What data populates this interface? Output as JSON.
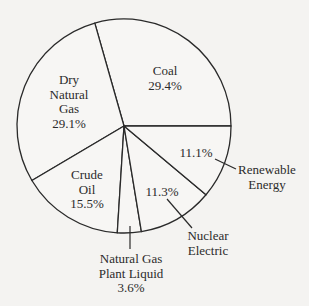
{
  "chart_data": {
    "type": "pie",
    "title": "",
    "start_angle_deg": 0,
    "direction": "counterclockwise",
    "grid": false,
    "legend": "none (direct labels)",
    "slices": [
      {
        "name": "Coal",
        "value": 29.4,
        "label_lines": [
          "Coal",
          "29.4%"
        ]
      },
      {
        "name": "Dry Natural Gas",
        "value": 29.1,
        "label_lines": [
          "Dry",
          "Natural",
          "Gas",
          "29.1%"
        ]
      },
      {
        "name": "Crude Oil",
        "value": 15.5,
        "label_lines": [
          "Crude",
          "Oil",
          "15.5%"
        ]
      },
      {
        "name": "Natural Gas Plant Liquid",
        "value": 3.6,
        "label_lines": [
          "Natural Gas",
          "Plant Liquid",
          "3.6%"
        ]
      },
      {
        "name": "Nuclear Electric",
        "value": 11.3,
        "label_lines": [
          "11.3%"
        ],
        "callout_lines": [
          "Nuclear",
          "Electric"
        ]
      },
      {
        "name": "Renewable Energy",
        "value": 11.1,
        "label_lines": [
          "11.1%"
        ],
        "callout_lines": [
          "Renewable",
          "Energy"
        ]
      }
    ],
    "categories": [
      "Coal",
      "Dry Natural Gas",
      "Crude Oil",
      "Natural Gas Plant Liquid",
      "Nuclear Electric",
      "Renewable Energy"
    ],
    "values": [
      29.4,
      29.1,
      15.5,
      3.6,
      11.3,
      11.1
    ],
    "units": "%"
  },
  "style": {
    "background": "#f4f3f1",
    "slice_fill": "#f7f6f4",
    "stroke": "#2a2a2a"
  },
  "labels": {
    "coal": {
      "l1": "Coal",
      "l2": "29.4%"
    },
    "dry_gas": {
      "l1": "Dry",
      "l2": "Natural",
      "l3": "Gas",
      "l4": "29.1%"
    },
    "crude": {
      "l1": "Crude",
      "l2": "Oil",
      "l3": "15.5%"
    },
    "ngpl": {
      "l1": "Natural Gas",
      "l2": "Plant Liquid",
      "l3": "3.6%"
    },
    "nuclear": {
      "pct": "11.3%",
      "l1": "Nuclear",
      "l2": "Electric"
    },
    "renewable": {
      "pct": "11.1%",
      "l1": "Renewable",
      "l2": "Energy"
    }
  }
}
